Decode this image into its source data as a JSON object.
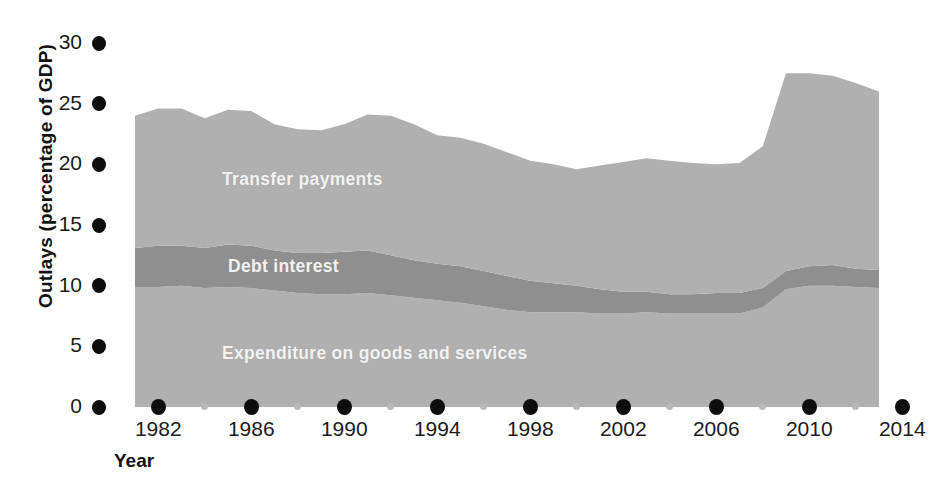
{
  "chart_data": {
    "type": "area",
    "stacked": true,
    "title": "",
    "xlabel": "Year",
    "ylabel": "Outlays (percentage of GDP)",
    "xlim": [
      1981,
      2014
    ],
    "ylim": [
      0,
      30
    ],
    "grid": false,
    "legend_position": "inline-labels",
    "y_ticks": [
      0,
      5,
      10,
      15,
      20,
      25,
      30
    ],
    "x_ticks_major": [
      1982,
      1986,
      1990,
      1994,
      1998,
      2002,
      2006,
      2010,
      2014
    ],
    "x_ticks_minor": [
      1984,
      1988,
      1992,
      1996,
      2000,
      2004,
      2008,
      2012
    ],
    "x": [
      1981,
      1982,
      1983,
      1984,
      1985,
      1986,
      1987,
      1988,
      1989,
      1990,
      1991,
      1992,
      1993,
      1994,
      1995,
      1996,
      1997,
      1998,
      1999,
      2000,
      2001,
      2002,
      2003,
      2004,
      2005,
      2006,
      2007,
      2008,
      2009,
      2010,
      2011,
      2012,
      2013
    ],
    "series": [
      {
        "name": "Expenditure on goods and services",
        "color": "#b0b0b0",
        "values": [
          9.9,
          9.9,
          10.0,
          9.8,
          9.9,
          9.8,
          9.6,
          9.4,
          9.3,
          9.3,
          9.4,
          9.2,
          9.0,
          8.8,
          8.6,
          8.3,
          8.0,
          7.8,
          7.8,
          7.8,
          7.7,
          7.7,
          7.8,
          7.7,
          7.7,
          7.7,
          7.7,
          8.2,
          9.7,
          10.0,
          10.0,
          9.9,
          9.8
        ]
      },
      {
        "name": "Debt interest",
        "color": "#8f8f8f",
        "values": [
          3.2,
          3.4,
          3.3,
          3.3,
          3.5,
          3.5,
          3.3,
          3.3,
          3.4,
          3.5,
          3.5,
          3.3,
          3.1,
          3.0,
          3.0,
          2.9,
          2.8,
          2.6,
          2.4,
          2.2,
          2.0,
          1.8,
          1.7,
          1.6,
          1.6,
          1.7,
          1.7,
          1.6,
          1.5,
          1.6,
          1.7,
          1.5,
          1.5
        ]
      },
      {
        "name": "Transfer payments",
        "color": "#b0b0b0",
        "values": [
          10.9,
          11.3,
          11.3,
          10.7,
          11.1,
          11.1,
          10.4,
          10.2,
          10.1,
          10.5,
          11.2,
          11.5,
          11.2,
          10.6,
          10.6,
          10.5,
          10.2,
          9.9,
          9.8,
          9.6,
          10.2,
          10.7,
          11.0,
          11.0,
          10.8,
          10.6,
          10.7,
          11.7,
          16.3,
          15.9,
          15.6,
          15.3,
          14.7
        ]
      }
    ]
  },
  "axis": {
    "y_title": "Outlays (percentage of GDP)",
    "x_title": "Year",
    "y_tick_labels": [
      "0",
      "5",
      "10",
      "15",
      "20",
      "25",
      "30"
    ],
    "x_tick_labels": [
      "1982",
      "1986",
      "1990",
      "1994",
      "1998",
      "2002",
      "2006",
      "2010",
      "2014"
    ]
  },
  "inline_labels": {
    "transfer": "Transfer payments",
    "debt": "Debt interest",
    "expenditure": "Expenditure on goods and services"
  },
  "colors": {
    "light_band": "#b0b0b0",
    "dark_band": "#8f8f8f",
    "tick_major": "#0d0d0d",
    "tick_minor": "#b9b9b9",
    "text": "#1a1a1a",
    "inline_label": "#f2f2f2",
    "background": "#ffffff"
  }
}
